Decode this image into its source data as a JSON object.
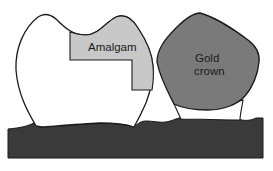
{
  "diagram": {
    "labels": {
      "amalgam": "Amalgam",
      "gold_line1": "Gold",
      "gold_line2": "crown"
    },
    "colors": {
      "tooth": "#ffffff",
      "amalgam": "#c8c8c8",
      "gold_crown": "#7a7a7a",
      "gum": "#3a3a3a",
      "outline": "#1a1a1a"
    }
  }
}
